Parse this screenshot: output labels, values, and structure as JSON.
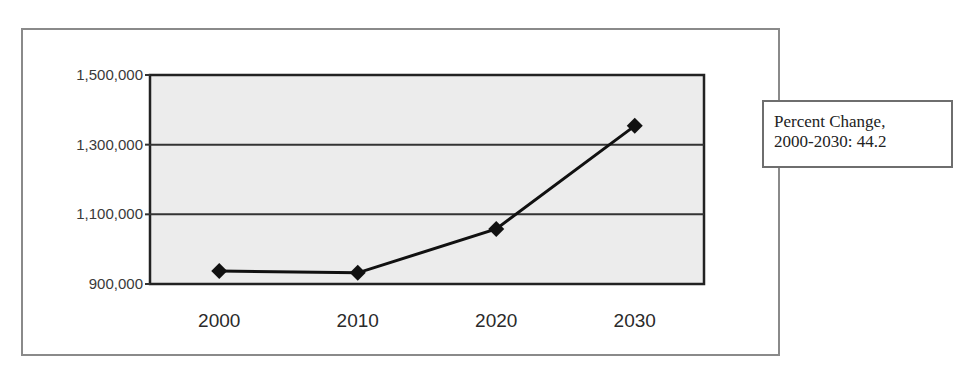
{
  "chart_data": {
    "type": "line",
    "title": "",
    "xlabel": "",
    "ylabel": "",
    "categories": [
      "2000",
      "2010",
      "2020",
      "2030"
    ],
    "values": [
      937000,
      932000,
      1058000,
      1354000
    ],
    "series": [
      {
        "name": "Population",
        "values": [
          937000,
          932000,
          1058000,
          1354000
        ],
        "marker": "diamond",
        "color": "#111111"
      }
    ],
    "ylim": [
      900000,
      1500000
    ],
    "yticks": [
      900000,
      1100000,
      1300000,
      1500000
    ],
    "ytick_labels": [
      "900,000",
      "1,100,000",
      "1,300,000",
      "1,500,000"
    ],
    "grid": true,
    "plot_background": "#ececec",
    "annotation": {
      "line1": "Percent Change,",
      "line2": "2000-2030: 44.2"
    }
  },
  "annotation": {
    "line1": "Percent Change,",
    "line2": "2000-2030: 44.2"
  }
}
